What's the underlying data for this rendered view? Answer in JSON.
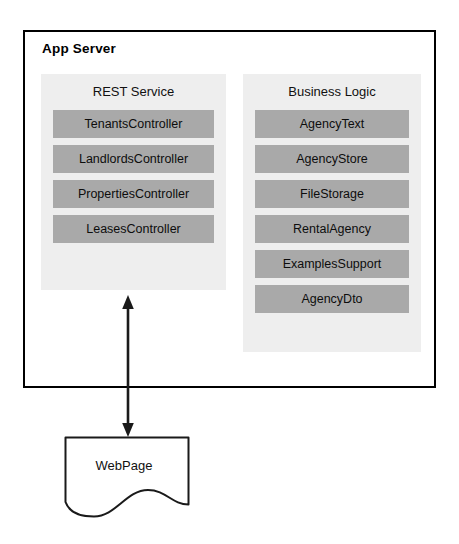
{
  "diagram": {
    "container": {
      "title": "App Server"
    },
    "groups": [
      {
        "name": "rest-service",
        "title": "REST Service",
        "components": [
          "TenantsController",
          "LandlordsController",
          "PropertiesController",
          "LeasesController"
        ]
      },
      {
        "name": "business-logic",
        "title": "Business Logic",
        "components": [
          "AgencyText",
          "AgencyStore",
          "FileStorage",
          "RentalAgency",
          "ExamplesSupport",
          "AgencyDto"
        ]
      }
    ],
    "external": {
      "label": "WebPage",
      "shape": "document"
    },
    "connector": {
      "name": "double-headed-arrow",
      "direction": "bidirectional",
      "from": "rest-service",
      "to": "WebPage"
    },
    "colors": {
      "border": "#000000",
      "panel_background": "#eeeeee",
      "component_background": "#a9a9a9",
      "text": "#111111",
      "page_background": "#ffffff"
    }
  }
}
